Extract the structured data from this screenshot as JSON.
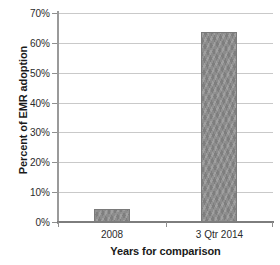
{
  "chart_data": {
    "type": "bar",
    "title": "",
    "categories": [
      "2008",
      "3 Qtr 2014"
    ],
    "values": [
      4.3,
      63.5
    ],
    "xlabel": "Years for comparison",
    "ylabel": "Percent of EMR adoption",
    "ylim": [
      0,
      70
    ],
    "ytick_values": [
      0,
      10,
      20,
      30,
      40,
      50,
      60,
      70
    ],
    "ytick_labels": [
      "0%",
      "10%",
      "20%",
      "30%",
      "40%",
      "50%",
      "60%",
      "70%"
    ],
    "grid": true,
    "legend": false,
    "series": [
      {
        "name": "EMR adoption",
        "values": [
          4.3,
          63.5
        ],
        "color": "#8d8d8d"
      }
    ]
  },
  "colors": {
    "bar_fill": "#8d8d8d",
    "bar_border": "#7a7a7a",
    "gridline": "#c9c9c9",
    "axis_line": "#8f8f8f",
    "text": "#2b2b2b",
    "background": "#ffffff"
  }
}
